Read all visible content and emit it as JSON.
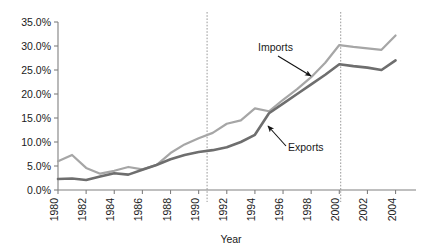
{
  "chart_data": {
    "type": "line",
    "title": "",
    "xlabel": "Year",
    "ylabel": "",
    "x": [
      1980,
      1981,
      1982,
      1983,
      1984,
      1985,
      1986,
      1987,
      1988,
      1989,
      1990,
      1991,
      1992,
      1993,
      1994,
      1995,
      1996,
      1997,
      1998,
      1999,
      2000,
      2001,
      2002,
      2003,
      2004
    ],
    "xlim": [
      1980,
      2004.6
    ],
    "ylim": [
      0,
      35
    ],
    "grid": false,
    "legend_position": "inline-annotations",
    "x_tick_labels": [
      "1980",
      "1982",
      "1984",
      "1986",
      "1988",
      "1990",
      "1992",
      "1994",
      "1996",
      "1998",
      "2000",
      "2002",
      "2004"
    ],
    "x_tick_values": [
      1980,
      1982,
      1984,
      1986,
      1988,
      1990,
      1992,
      1994,
      1996,
      1998,
      2000,
      2002,
      2004
    ],
    "y_tick_labels": [
      "0.0%",
      "5.0%",
      "10.0%",
      "15.0%",
      "20.0%",
      "25.0%",
      "30.0%",
      "35.0%"
    ],
    "y_tick_values": [
      0,
      5,
      10,
      15,
      20,
      25,
      30,
      35
    ],
    "series": [
      {
        "name": "Imports",
        "color": "#a6a6a6",
        "width": 2.2,
        "values": [
          6.0,
          7.3,
          4.6,
          3.4,
          4.0,
          4.8,
          4.3,
          5.2,
          7.7,
          9.5,
          10.8,
          11.9,
          13.8,
          14.5,
          17.0,
          16.4,
          18.8,
          21.0,
          23.5,
          26.5,
          30.2,
          29.8,
          29.5,
          29.2,
          32.2
        ]
      },
      {
        "name": "Exports",
        "color": "#6e6e6e",
        "width": 2.6,
        "values": [
          2.3,
          2.4,
          2.1,
          2.8,
          3.5,
          3.2,
          4.2,
          5.2,
          6.4,
          7.3,
          7.9,
          8.3,
          8.9,
          10.0,
          11.5,
          16.0,
          18.0,
          20.0,
          22.0,
          24.0,
          26.2,
          25.8,
          25.5,
          25.0,
          27.0
        ]
      }
    ],
    "reference_lines": [
      {
        "name": "reference-line-1991",
        "x": 1990.6,
        "style": "dotted",
        "color": "#9a9a9a"
      },
      {
        "name": "reference-line-2000",
        "x": 2000.1,
        "style": "dotted",
        "color": "#9a9a9a"
      }
    ],
    "annotations": [
      {
        "name": "imports-annotation",
        "text": "Imports",
        "text_x": 258,
        "text_y": 51,
        "arrow_from_x": 278,
        "arrow_from_y": 56,
        "arrow_to_x": 311,
        "arrow_to_y": 76
      },
      {
        "name": "exports-annotation",
        "text": "Exports",
        "text_x": 288,
        "text_y": 151,
        "arrow_from_x": 286,
        "arrow_from_y": 146,
        "arrow_to_x": 268,
        "arrow_to_y": 126
      }
    ]
  }
}
